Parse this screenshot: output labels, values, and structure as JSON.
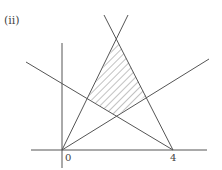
{
  "figure": {
    "label": "(ii)",
    "tick_labels": {
      "origin": "0",
      "four": "4"
    },
    "colors": {
      "line": "#555555",
      "hatch": "#777777",
      "text": "#444444"
    }
  },
  "diagram": {
    "type": "linear-programming feasible region",
    "axes": {
      "x_axis": true,
      "y_axis": true
    },
    "lines": [
      {
        "name": "steep line through origin",
        "from": [
          0,
          0
        ],
        "direction": "up-right steep"
      },
      {
        "name": "steep line through x=4",
        "from": [
          4,
          0
        ],
        "direction": "up-left steep"
      },
      {
        "name": "shallow line through origin",
        "from": [
          0,
          0
        ],
        "direction": "up-right shallow"
      },
      {
        "name": "shallow line through x=4",
        "from": [
          4,
          0
        ],
        "direction": "up-left shallow"
      }
    ],
    "shaded_region": "quadrilateral bounded above by the two steep lines and below by the two shallow lines"
  }
}
